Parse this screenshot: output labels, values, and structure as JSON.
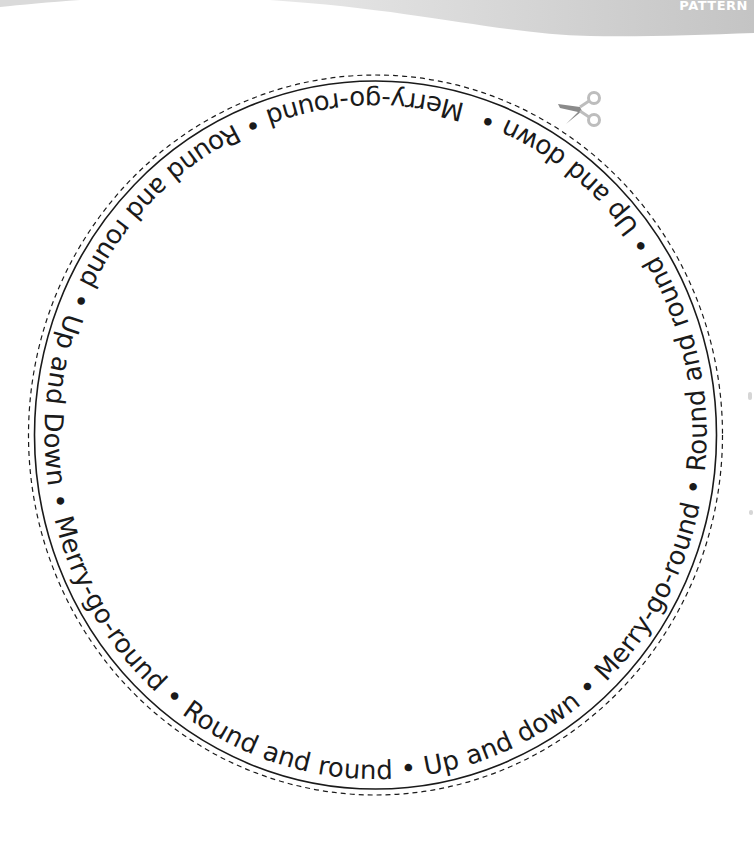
{
  "header": {
    "section_label": "PATTERN",
    "banner_color_light": "#e6e6e6",
    "banner_color_dark": "#c6c6c6"
  },
  "pattern": {
    "shape": "circle",
    "cut_line_style": "dashed",
    "fold_line_style": "solid",
    "line_color": "#1a1a1a",
    "ring_text": "Merry-go-round • Round and round • Up and Down • Merry-go-round • Round and round • Up and down • Merry-go-round • Round and round • Up and down • ",
    "phrases": [
      "Merry-go-round",
      "Round and round",
      "Up and Down",
      "Merry-go-round",
      "Round and round",
      "Up and down",
      "Merry-go-round",
      "Round and round",
      "Up and down"
    ],
    "separator": "•"
  },
  "icons": {
    "cut_here": "scissors-icon",
    "scissors_blade_color": "#8a8a8a",
    "scissors_handle_color": "#bdbdbd"
  }
}
